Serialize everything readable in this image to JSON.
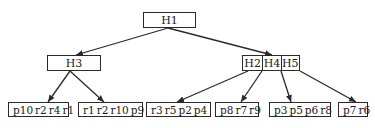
{
  "diagram": {
    "type": "tree",
    "root": {
      "id": "H1",
      "label": "H1"
    },
    "level2": {
      "left": {
        "id": "H3",
        "label": "H3"
      },
      "right": {
        "id": "H2-H4-H5",
        "cells": [
          "H2",
          "H4",
          "H5"
        ]
      }
    },
    "leaves": [
      {
        "id": "leaf1",
        "items": [
          "p10",
          "r2",
          "r4",
          "r1"
        ],
        "parent": "H3"
      },
      {
        "id": "leaf2",
        "items": [
          "r1",
          "r2",
          "r10",
          "p9"
        ],
        "parent": "H3"
      },
      {
        "id": "leaf3",
        "items": [
          "r3",
          "r5",
          "p2",
          "p4"
        ],
        "parent": "H2"
      },
      {
        "id": "leaf4",
        "items": [
          "p8",
          "r7",
          "r9"
        ],
        "parent": "H4"
      },
      {
        "id": "leaf5",
        "items": [
          "p3",
          "p5",
          "p6",
          "r8"
        ],
        "parent": "H5"
      },
      {
        "id": "leaf6",
        "items": [
          "p7",
          "r6"
        ],
        "parent": "H5"
      }
    ],
    "edges": [
      {
        "from": "H1",
        "to": "H3"
      },
      {
        "from": "H1",
        "to": "H2-H4-H5"
      },
      {
        "from": "H3",
        "to": "leaf1"
      },
      {
        "from": "H3",
        "to": "leaf2"
      },
      {
        "from": "H2",
        "to": "leaf3"
      },
      {
        "from": "H4",
        "to": "leaf4"
      },
      {
        "from": "H5",
        "to": "leaf5"
      },
      {
        "from": "H5",
        "to": "leaf6"
      }
    ],
    "colors": {
      "stroke": "#2a2a2a",
      "background": "#ffffff",
      "text": "#1a1a1a"
    }
  }
}
